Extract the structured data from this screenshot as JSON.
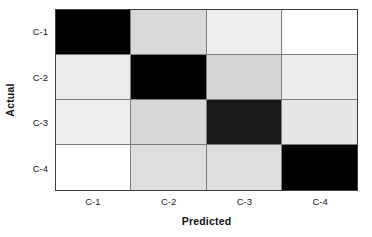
{
  "chart_data": {
    "type": "heatmap",
    "title": "",
    "xlabel": "Predicted",
    "ylabel": "Actual",
    "categories_x": [
      "C-1",
      "C-2",
      "C-3",
      "C-4"
    ],
    "categories_y": [
      "C-1",
      "C-2",
      "C-3",
      "C-4"
    ],
    "grid": true,
    "legend": false,
    "colormap": "grayscale-inverted",
    "note": "Confusion matrix rendered in grayscale; darker cell = higher value. Diagonal cells are darkest (correct classifications).",
    "rows": [
      {
        "actual": "C-1",
        "cells": [
          {
            "predicted": "C-1",
            "color": "#000000",
            "intensity": 1.0
          },
          {
            "predicted": "C-2",
            "color": "#d9d9d9",
            "intensity": 0.15
          },
          {
            "predicted": "C-3",
            "color": "#ededed",
            "intensity": 0.07
          },
          {
            "predicted": "C-4",
            "color": "#ffffff",
            "intensity": 0.0
          }
        ]
      },
      {
        "actual": "C-2",
        "cells": [
          {
            "predicted": "C-1",
            "color": "#ebebeb",
            "intensity": 0.08
          },
          {
            "predicted": "C-2",
            "color": "#000000",
            "intensity": 1.0
          },
          {
            "predicted": "C-3",
            "color": "#d6d6d6",
            "intensity": 0.16
          },
          {
            "predicted": "C-4",
            "color": "#ececec",
            "intensity": 0.08
          }
        ]
      },
      {
        "actual": "C-3",
        "cells": [
          {
            "predicted": "C-1",
            "color": "#ededed",
            "intensity": 0.07
          },
          {
            "predicted": "C-2",
            "color": "#d8d8d8",
            "intensity": 0.15
          },
          {
            "predicted": "C-3",
            "color": "#1a1a1a",
            "intensity": 0.92
          },
          {
            "predicted": "C-4",
            "color": "#e6e6e6",
            "intensity": 0.1
          }
        ]
      },
      {
        "actual": "C-4",
        "cells": [
          {
            "predicted": "C-1",
            "color": "#ffffff",
            "intensity": 0.0
          },
          {
            "predicted": "C-2",
            "color": "#dedede",
            "intensity": 0.13
          },
          {
            "predicted": "C-3",
            "color": "#dedede",
            "intensity": 0.13
          },
          {
            "predicted": "C-4",
            "color": "#000000",
            "intensity": 1.0
          }
        ]
      }
    ]
  },
  "axes": {
    "y_title": "Actual",
    "x_title": "Predicted",
    "y_ticks": [
      "C-1",
      "C-2",
      "C-3",
      "C-4"
    ],
    "x_ticks": [
      "C-1",
      "C-2",
      "C-3",
      "C-4"
    ]
  },
  "style": {
    "border_color": "#3d3d3d",
    "gridline_color": "#7d7d7d",
    "background": "#ffffff",
    "text_color": "#1a1a1a"
  }
}
